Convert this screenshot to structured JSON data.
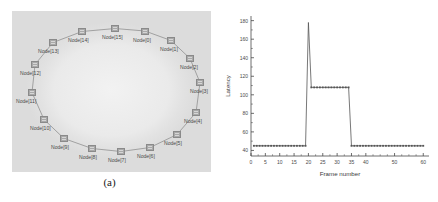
{
  "figure": {
    "panels": [
      {
        "id": "a",
        "caption": "(a)",
        "kind": "ring-topology-diagram"
      },
      {
        "id": "b",
        "caption": "(b)",
        "kind": "line-chart"
      }
    ]
  },
  "topology": {
    "type": "ring",
    "node_count": 16,
    "node_label_prefix": "Node",
    "background_color": "#dcdcdc",
    "node_color": "#a9a9a9",
    "link_color": "#9a9a9a",
    "nodes": [
      {
        "label": "Node[15]",
        "index": 15,
        "x": 99.0,
        "y": 14.0,
        "label_dx": -9,
        "label_dy": 9,
        "align": "left"
      },
      {
        "label": "Node[0]",
        "index": 0,
        "x": 129.0,
        "y": 16.5,
        "label_dx": -8,
        "label_dy": 9,
        "align": "left"
      },
      {
        "label": "Node[1]",
        "index": 1,
        "x": 155.0,
        "y": 26.0,
        "label_dx": -7,
        "label_dy": 9,
        "align": "left"
      },
      {
        "label": "Node[2]",
        "index": 2,
        "x": 174.0,
        "y": 44.0,
        "label_dx": -6,
        "label_dy": 9,
        "align": "left"
      },
      {
        "label": "Node[3]",
        "index": 3,
        "x": 184.0,
        "y": 68.0,
        "label_dx": -6,
        "label_dy": 9,
        "align": "left"
      },
      {
        "label": "Node[4]",
        "index": 4,
        "x": 180.0,
        "y": 98.0,
        "label_dx": -8,
        "label_dy": 9,
        "align": "left"
      },
      {
        "label": "Node[5]",
        "index": 5,
        "x": 161.0,
        "y": 120.0,
        "label_dx": -9,
        "label_dy": 9,
        "align": "left"
      },
      {
        "label": "Node[6]",
        "index": 6,
        "x": 134.0,
        "y": 133.0,
        "label_dx": -9,
        "label_dy": 9,
        "align": "left"
      },
      {
        "label": "Node[7]",
        "index": 7,
        "x": 105.0,
        "y": 137.0,
        "label_dx": -9,
        "label_dy": 9,
        "align": "left"
      },
      {
        "label": "Node[8]",
        "index": 8,
        "x": 76.0,
        "y": 134.0,
        "label_dx": -9,
        "label_dy": 9,
        "align": "left"
      },
      {
        "label": "Node[9]",
        "index": 9,
        "x": 48.0,
        "y": 124.0,
        "label_dx": -9,
        "label_dy": 9,
        "align": "left"
      },
      {
        "label": "Node[10]",
        "index": 10,
        "x": 28.0,
        "y": 105.0,
        "label_dx": -10,
        "label_dy": 9,
        "align": "left"
      },
      {
        "label": "Node[11]",
        "index": 11,
        "x": 16.0,
        "y": 78.0,
        "label_dx": -12,
        "label_dy": 9,
        "align": "left"
      },
      {
        "label": "Node[12]",
        "index": 12,
        "x": 19.0,
        "y": 50.0,
        "label_dx": -11,
        "label_dy": 9,
        "align": "left"
      },
      {
        "label": "Node[13]",
        "index": 13,
        "x": 37.0,
        "y": 28.0,
        "label_dx": -11,
        "label_dy": 9,
        "align": "left"
      },
      {
        "label": "Node[14]",
        "index": 14,
        "x": 66.0,
        "y": 17.0,
        "label_dx": -10,
        "label_dy": 9,
        "align": "left"
      }
    ]
  },
  "chart_data": {
    "type": "line",
    "title": "",
    "xlabel": "Frame number",
    "ylabel": "Latency",
    "xlim": [
      0,
      62
    ],
    "ylim": [
      34,
      185
    ],
    "grid": false,
    "legend": null,
    "xticks": [
      0,
      5,
      10,
      15,
      20,
      25,
      30,
      35,
      40,
      50,
      60
    ],
    "xtick_labels": [
      "0",
      "5",
      "10",
      "15",
      "20",
      "25",
      "30",
      "35",
      "40",
      "50",
      "60"
    ],
    "yticks": [
      40,
      60,
      80,
      100,
      120,
      140,
      160,
      180
    ],
    "ytick_labels": [
      "40",
      "60",
      "80",
      "100",
      "120",
      "140",
      "160",
      "180"
    ],
    "line_color": "#555555",
    "marker": "square",
    "series": [
      {
        "name": "Latency",
        "x": [
          1,
          2,
          3,
          4,
          5,
          6,
          7,
          8,
          9,
          10,
          11,
          12,
          13,
          14,
          15,
          16,
          17,
          18,
          19,
          20,
          21,
          22,
          23,
          24,
          25,
          26,
          27,
          28,
          29,
          30,
          31,
          32,
          33,
          34,
          35,
          36,
          37,
          38,
          39,
          40,
          41,
          42,
          43,
          44,
          45,
          46,
          47,
          48,
          49,
          50,
          51,
          52,
          53,
          54,
          55,
          56,
          57,
          58,
          59,
          60
        ],
        "values": [
          45,
          45,
          45,
          45,
          45,
          45,
          45,
          45,
          45,
          45,
          45,
          45,
          45,
          45,
          45,
          45,
          45,
          45,
          45,
          178,
          108,
          108,
          108,
          108,
          108,
          108,
          108,
          108,
          108,
          108,
          108,
          108,
          108,
          108,
          45,
          45,
          45,
          45,
          45,
          45,
          45,
          45,
          45,
          45,
          45,
          45,
          45,
          45,
          45,
          45,
          45,
          45,
          45,
          45,
          45,
          45,
          45,
          45,
          45,
          45
        ]
      }
    ]
  }
}
